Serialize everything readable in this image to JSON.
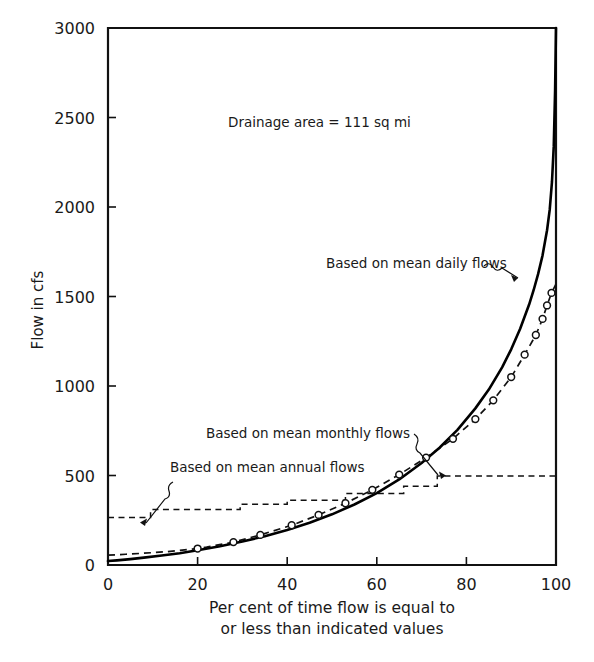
{
  "chart_data": {
    "type": "line",
    "title": "",
    "xlabel": "Per cent of time flow is equal to or less than indicated values",
    "ylabel": "Flow in cfs",
    "xlim": [
      0,
      100
    ],
    "ylim": [
      0,
      3000
    ],
    "grid": false,
    "legend_position": "inline-annotations",
    "xticks": [
      "0",
      "20",
      "40",
      "60",
      "80",
      "100"
    ],
    "xtick_values": [
      0,
      20,
      40,
      60,
      80,
      100
    ],
    "yticks": [
      "0",
      "500",
      "1000",
      "1500",
      "2000",
      "2500",
      "3000"
    ],
    "ytick_values": [
      0,
      500,
      1000,
      1500,
      2000,
      2500,
      3000
    ],
    "annotations": [
      {
        "name": "drainage-area-note",
        "text": "Drainage area = 111 sq mi",
        "x": 37,
        "y": 2480
      }
    ],
    "series": [
      {
        "name": "Based on mean daily flows",
        "style": "solid",
        "marker": "none",
        "label_x": 52,
        "label_y": 1700,
        "pointer_x": 95,
        "pointer_y": 1580,
        "x": [
          0,
          2,
          5,
          8,
          12,
          16,
          20,
          25,
          30,
          35,
          40,
          45,
          50,
          55,
          60,
          65,
          70,
          74,
          78,
          82,
          85,
          88,
          90,
          92,
          94,
          95,
          96,
          97,
          98,
          98.6,
          99.1,
          99.5,
          99.8,
          100
        ],
        "y": [
          22,
          26,
          33,
          41,
          53,
          66,
          82,
          105,
          131,
          161,
          196,
          236,
          283,
          338,
          402,
          478,
          570,
          655,
          755,
          875,
          980,
          1105,
          1205,
          1320,
          1455,
          1535,
          1625,
          1730,
          1870,
          1985,
          2140,
          2340,
          2650,
          3000
        ]
      },
      {
        "name": "Based on mean monthly flows",
        "style": "dashed",
        "marker": "circle",
        "label_x": 41,
        "label_y": 640,
        "pointer_x": 89,
        "pointer_y": 1120,
        "x": [
          0,
          4,
          8,
          13,
          20,
          22,
          28,
          34,
          41,
          47,
          53,
          59,
          65,
          71,
          77,
          82,
          86,
          90,
          93,
          95.5,
          97,
          98,
          99,
          100
        ],
        "y": [
          55,
          60,
          66,
          74,
          92,
          100,
          128,
          168,
          222,
          280,
          345,
          420,
          505,
          600,
          705,
          815,
          920,
          1050,
          1175,
          1285,
          1375,
          1450,
          1520,
          1570
        ],
        "marker_x": [
          20,
          28,
          34,
          41,
          47,
          53,
          59,
          65,
          71,
          77,
          82,
          86,
          90,
          93,
          95.5,
          97,
          98,
          99
        ],
        "marker_y": [
          92,
          128,
          168,
          222,
          280,
          345,
          420,
          505,
          600,
          705,
          815,
          920,
          1050,
          1175,
          1285,
          1375,
          1450,
          1520
        ]
      },
      {
        "name": "Based on mean annual flows",
        "style": "dashed-step",
        "marker": "none",
        "label_x": 25,
        "label_y": 760,
        "pointer_x": 10.5,
        "pointer_y": 300,
        "step_x": [
          0,
          9.5,
          9.5,
          29.5,
          29.5,
          40,
          40,
          53,
          53,
          66,
          66,
          73.5,
          73.5,
          100
        ],
        "step_y": [
          265,
          265,
          310,
          310,
          340,
          340,
          362,
          362,
          400,
          400,
          440,
          440,
          497,
          497
        ]
      }
    ]
  },
  "axes": {
    "y_axis_title": "Flow in cfs",
    "x_caption_line1": "Per cent of time flow is equal to",
    "x_caption_line2": "or less than indicated values"
  },
  "labels": {
    "daily": "Based on mean daily flows",
    "monthly": "Based on mean monthly flows",
    "annual": "Based on mean annual flows",
    "drainage": "Drainage area = 111 sq mi"
  },
  "colors": {
    "ink": "#111111",
    "background": "#ffffff"
  }
}
